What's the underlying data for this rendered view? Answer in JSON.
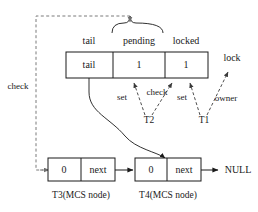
{
  "diagram": {
    "lock_word": {
      "fields": [
        {
          "header": "tail",
          "value": "tail"
        },
        {
          "header": "pending",
          "value": "1"
        },
        {
          "header": "locked",
          "value": "1"
        }
      ]
    },
    "brace_label": "lock",
    "annotations": {
      "check_left": "check",
      "set_pending": "set",
      "check_locked": "check",
      "set_locked": "set",
      "owner": "owner"
    },
    "threads": [
      {
        "name": "T2"
      },
      {
        "name": "T1"
      }
    ],
    "mcs_nodes": [
      {
        "caption": "T3(MCS node)",
        "cells": [
          {
            "value": "0"
          },
          {
            "value": "next"
          }
        ]
      },
      {
        "caption": "T4(MCS node)",
        "cells": [
          {
            "value": "0"
          },
          {
            "value": "next"
          }
        ]
      }
    ],
    "terminator": "NULL",
    "colors": {
      "stroke": "#1a1a1a",
      "dashed": "#7a7a7a",
      "background": "#ffffff"
    }
  }
}
